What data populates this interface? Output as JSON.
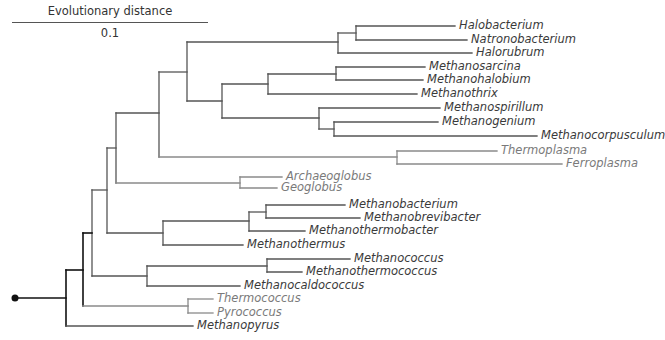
{
  "scale": {
    "title": "Evolutionary distance",
    "value": "0.1"
  },
  "colors": {
    "root_line": "#111111",
    "branch_dark": "#555555",
    "branch_light": "#8a8a8a",
    "label_dark": "#3a3a3a",
    "label_light": "#7a7a7a"
  },
  "leaves": [
    {
      "name": "Halobacterium",
      "y": 26,
      "tip_x": 455,
      "tone": "dark"
    },
    {
      "name": "Natronobacterium",
      "y": 40,
      "tip_x": 467,
      "tone": "dark"
    },
    {
      "name": "Halorubrum",
      "y": 53,
      "tip_x": 472,
      "tone": "dark"
    },
    {
      "name": "Methanosarcina",
      "y": 67,
      "tip_x": 425,
      "tone": "dark"
    },
    {
      "name": "Methanohalobium",
      "y": 80,
      "tip_x": 423,
      "tone": "dark"
    },
    {
      "name": "Methanothrix",
      "y": 94,
      "tip_x": 417,
      "tone": "dark"
    },
    {
      "name": "Methanospirillum",
      "y": 108,
      "tip_x": 440,
      "tone": "dark"
    },
    {
      "name": "Methanogenium",
      "y": 122,
      "tip_x": 438,
      "tone": "dark"
    },
    {
      "name": "Methanocorpusculum",
      "y": 136,
      "tip_x": 537,
      "tone": "dark"
    },
    {
      "name": "Thermoplasma",
      "y": 151,
      "tip_x": 497,
      "tone": "light"
    },
    {
      "name": "Ferroplasma",
      "y": 164,
      "tip_x": 562,
      "tone": "light"
    },
    {
      "name": "Archaeoglobus",
      "y": 177,
      "tip_x": 282,
      "tone": "light"
    },
    {
      "name": "Geoglobus",
      "y": 188,
      "tip_x": 277,
      "tone": "light"
    },
    {
      "name": "Methanobacterium",
      "y": 205,
      "tip_x": 345,
      "tone": "dark"
    },
    {
      "name": "Methanobrevibacter",
      "y": 218,
      "tip_x": 360,
      "tone": "dark"
    },
    {
      "name": "Methanothermobacter",
      "y": 231,
      "tip_x": 305,
      "tone": "dark"
    },
    {
      "name": "Methanothermus",
      "y": 245,
      "tip_x": 243,
      "tone": "dark"
    },
    {
      "name": "Methanococcus",
      "y": 259,
      "tip_x": 350,
      "tone": "dark"
    },
    {
      "name": "Methanothermococcus",
      "y": 272,
      "tip_x": 302,
      "tone": "dark"
    },
    {
      "name": "Methanocaldococcus",
      "y": 286,
      "tip_x": 240,
      "tone": "dark"
    },
    {
      "name": "Thermococcus",
      "y": 299,
      "tip_x": 213,
      "tone": "light"
    },
    {
      "name": "Pyrococcus",
      "y": 313,
      "tip_x": 213,
      "tone": "light"
    },
    {
      "name": "Methanopyrus",
      "y": 326,
      "tip_x": 193,
      "tone": "dark"
    }
  ],
  "nodes": [
    {
      "id": "root",
      "x": 66,
      "y1": 270,
      "y2": 326,
      "parent_x": 15,
      "y": 298,
      "tone": "root"
    },
    {
      "id": "n83",
      "x": 83,
      "y1": 233,
      "y2": 306,
      "parent_x": 66,
      "y": 270,
      "tone": "root"
    },
    {
      "id": "n92",
      "x": 92,
      "y1": 190,
      "y2": 276,
      "parent_x": 83,
      "y": 233,
      "tone": "dark"
    },
    {
      "id": "n107",
      "x": 107,
      "y1": 148,
      "y2": 233,
      "parent_x": 92,
      "y": 190,
      "tone": "dark"
    },
    {
      "id": "n116",
      "x": 116,
      "y1": 113,
      "y2": 183,
      "parent_x": 107,
      "y": 148,
      "tone": "dark"
    },
    {
      "id": "n159",
      "x": 159,
      "y1": 72,
      "y2": 157,
      "parent_x": 116,
      "y": 113,
      "tone": "dark"
    },
    {
      "id": "n187",
      "x": 187,
      "y1": 42,
      "y2": 101,
      "parent_x": 159,
      "y": 72,
      "tone": "dark"
    },
    {
      "id": "halo",
      "x": 338,
      "y1": 33,
      "y2": 53,
      "parent_x": 187,
      "y": 42,
      "tone": "dark"
    },
    {
      "id": "halo2",
      "x": 356,
      "y1": 26,
      "y2": 40,
      "parent_x": 338,
      "y": 33,
      "tone": "dark"
    },
    {
      "id": "n222",
      "x": 222,
      "y1": 84,
      "y2": 118,
      "parent_x": 187,
      "y": 101,
      "tone": "dark"
    },
    {
      "id": "n268",
      "x": 268,
      "y1": 74,
      "y2": 94,
      "parent_x": 222,
      "y": 84,
      "tone": "dark"
    },
    {
      "id": "n336",
      "x": 336,
      "y1": 67,
      "y2": 80,
      "parent_x": 268,
      "y": 74,
      "tone": "dark"
    },
    {
      "id": "n319",
      "x": 319,
      "y1": 108,
      "y2": 129,
      "parent_x": 222,
      "y": 118,
      "tone": "dark"
    },
    {
      "id": "n334",
      "x": 334,
      "y1": 122,
      "y2": 136,
      "parent_x": 319,
      "y": 129,
      "tone": "dark"
    },
    {
      "id": "thermoplasma",
      "x": 397,
      "y1": 151,
      "y2": 164,
      "parent_x": 159,
      "y": 157,
      "tone": "light"
    },
    {
      "id": "archaeo",
      "x": 240,
      "y1": 177,
      "y2": 188,
      "parent_x": 116,
      "y": 183,
      "tone": "light"
    },
    {
      "id": "n163",
      "x": 163,
      "y1": 221,
      "y2": 245,
      "parent_x": 107,
      "y": 233,
      "tone": "dark"
    },
    {
      "id": "n249",
      "x": 249,
      "y1": 212,
      "y2": 231,
      "parent_x": 163,
      "y": 221,
      "tone": "dark"
    },
    {
      "id": "n266",
      "x": 266,
      "y1": 205,
      "y2": 218,
      "parent_x": 249,
      "y": 212,
      "tone": "dark"
    },
    {
      "id": "n147",
      "x": 147,
      "y1": 266,
      "y2": 286,
      "parent_x": 92,
      "y": 276,
      "tone": "dark"
    },
    {
      "id": "n267",
      "x": 267,
      "y1": 259,
      "y2": 272,
      "parent_x": 147,
      "y": 266,
      "tone": "dark"
    },
    {
      "id": "thermococ",
      "x": 188,
      "y1": 299,
      "y2": 313,
      "parent_x": 83,
      "y": 306,
      "tone": "light"
    }
  ],
  "leaf_parents": {
    "Halobacterium": 356,
    "Natronobacterium": 356,
    "Halorubrum": 338,
    "Methanosarcina": 336,
    "Methanohalobium": 336,
    "Methanothrix": 268,
    "Methanospirillum": 319,
    "Methanogenium": 334,
    "Methanocorpusculum": 334,
    "Thermoplasma": 397,
    "Ferroplasma": 397,
    "Archaeoglobus": 240,
    "Geoglobus": 240,
    "Methanobacterium": 266,
    "Methanobrevibacter": 266,
    "Methanothermobacter": 249,
    "Methanothermus": 163,
    "Methanococcus": 267,
    "Methanothermococcus": 267,
    "Methanocaldococcus": 147,
    "Thermococcus": 188,
    "Pyrococcus": 188,
    "Methanopyrus": 66
  },
  "root_dot": {
    "x": 15,
    "y": 298
  }
}
